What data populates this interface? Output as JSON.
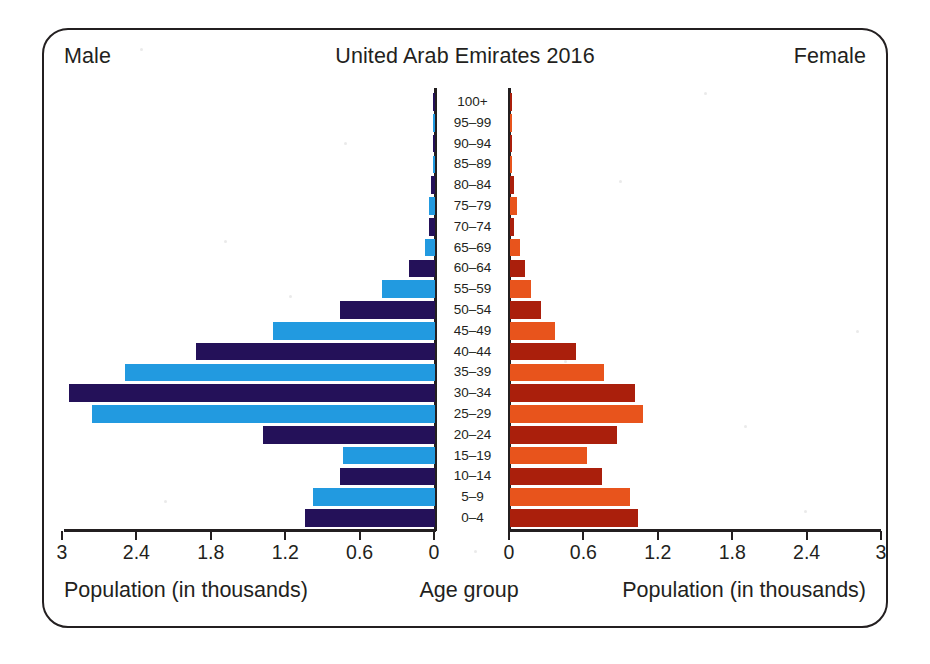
{
  "header": {
    "left_label": "Male",
    "title": "United Arab Emirates 2016",
    "right_label": "Female"
  },
  "footer": {
    "left_axis_label": "Population (in thousands)",
    "center_label": "Age group",
    "right_axis_label": "Population (in thousands)"
  },
  "colors": {
    "male_dark": "#241159",
    "male_light": "#229ae0",
    "female_dark": "#aa1f0c",
    "female_light": "#e8541c",
    "frame": "#231f20",
    "text": "#231f20",
    "background": "#ffffff"
  },
  "chart_data": {
    "type": "bar",
    "subtype": "population-pyramid",
    "title": "United Arab Emirates 2016",
    "xlabel": "Population (in thousands)",
    "ylabel": "Age group",
    "center_axis_label": "Age group",
    "grid": false,
    "legend": "none",
    "left_series_name": "Male",
    "right_series_name": "Female",
    "xlim_left": [
      3,
      0
    ],
    "xlim_right": [
      0,
      3
    ],
    "xticks_left": [
      "3",
      "2.4",
      "1.8",
      "1.2",
      "0.6",
      "0"
    ],
    "xticks_left_values": [
      3,
      2.4,
      1.8,
      1.2,
      0.6,
      0
    ],
    "xticks_right": [
      "0",
      "0.6",
      "1.2",
      "1.8",
      "2.4",
      "3"
    ],
    "xticks_right_values": [
      0,
      0.6,
      1.2,
      1.8,
      2.4,
      3
    ],
    "categories": [
      "100+",
      "95–99",
      "90–94",
      "85–89",
      "80–84",
      "75–79",
      "70–74",
      "65–69",
      "60–64",
      "55–59",
      "50–54",
      "45–49",
      "40–44",
      "35–39",
      "30–34",
      "25–29",
      "20–24",
      "15–19",
      "10–14",
      "5–9",
      "0–4"
    ],
    "series": [
      {
        "name": "Male",
        "side": "left",
        "values": [
          0.005,
          0.01,
          0.01,
          0.02,
          0.03,
          0.05,
          0.05,
          0.08,
          0.21,
          0.43,
          0.77,
          1.31,
          1.93,
          2.5,
          2.95,
          2.77,
          1.39,
          0.74,
          0.77,
          0.98,
          1.05
        ]
      },
      {
        "name": "Female",
        "side": "right",
        "values": [
          0.005,
          0.005,
          0.01,
          0.02,
          0.03,
          0.06,
          0.03,
          0.08,
          0.12,
          0.17,
          0.25,
          0.36,
          0.53,
          0.76,
          1.01,
          1.07,
          0.86,
          0.62,
          0.74,
          0.97,
          1.03
        ]
      }
    ]
  }
}
